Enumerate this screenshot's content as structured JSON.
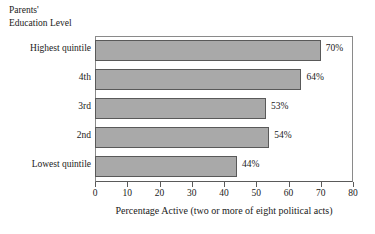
{
  "chart_data": {
    "type": "bar",
    "orientation": "horizontal",
    "title": "",
    "axis_group_title_lines": [
      "Parents'",
      "Education Level"
    ],
    "categories": [
      "Highest quintile",
      "4th",
      "3rd",
      "2nd",
      "Lowest quintile"
    ],
    "values": [
      70,
      64,
      53,
      54,
      44
    ],
    "data_labels": [
      "70%",
      "64%",
      "53%",
      "54%",
      "44%"
    ],
    "xlabel": "Percentage Active (two or more of eight political acts)",
    "ylabel": "Parents' Education Level",
    "xlim": [
      0,
      80
    ],
    "xticks": [
      0,
      10,
      20,
      30,
      40,
      50,
      60,
      70,
      80
    ],
    "xtick_labels": [
      "0",
      "10",
      "20",
      "30",
      "40",
      "50",
      "60",
      "70",
      "80"
    ],
    "grid": false,
    "legend": null,
    "bar_fill_color": "#a9a9a9",
    "bar_border_color": "#595959",
    "axis_color": "#5a5a5a",
    "background_color": "#ffffff"
  }
}
